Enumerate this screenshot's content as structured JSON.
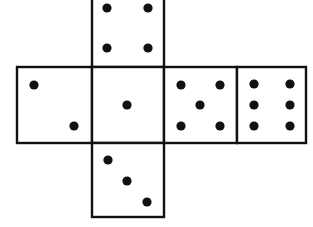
{
  "diagram": {
    "type": "cube-net",
    "background_color": "#ffffff",
    "line_color": "#111111",
    "pip_color": "#111111",
    "line_width": 2.4,
    "pip_radius": 4.6,
    "canvas": {
      "width": 313,
      "height": 227
    },
    "grid": {
      "columns_x": [
        17,
        92,
        164,
        237,
        306
      ],
      "rows_y": [
        -9,
        67,
        143,
        217
      ],
      "note": "top face is cropped at the top edge of the image"
    },
    "faces": [
      {
        "id": "face-top",
        "name": "top-face",
        "position": "top",
        "value": 4,
        "rect": {
          "x": 92,
          "y": -9,
          "width": 72,
          "height": 76
        },
        "pips": [
          {
            "cx": 107,
            "cy": 8
          },
          {
            "cx": 148,
            "cy": 8
          },
          {
            "cx": 107,
            "cy": 48
          },
          {
            "cx": 148,
            "cy": 48
          }
        ]
      },
      {
        "id": "face-left",
        "name": "left-face",
        "position": "left",
        "value": 2,
        "rect": {
          "x": 17,
          "y": 67,
          "width": 75,
          "height": 76
        },
        "pips": [
          {
            "cx": 34,
            "cy": 85
          },
          {
            "cx": 74,
            "cy": 126
          }
        ]
      },
      {
        "id": "face-center",
        "name": "center-face",
        "position": "center",
        "value": 1,
        "rect": {
          "x": 92,
          "y": 67,
          "width": 72,
          "height": 76
        },
        "pips": [
          {
            "cx": 127,
            "cy": 105
          }
        ]
      },
      {
        "id": "face-right",
        "name": "right-face",
        "position": "right",
        "value": 5,
        "rect": {
          "x": 164,
          "y": 67,
          "width": 73,
          "height": 76
        },
        "pips": [
          {
            "cx": 181,
            "cy": 85
          },
          {
            "cx": 220,
            "cy": 85
          },
          {
            "cx": 200,
            "cy": 105
          },
          {
            "cx": 181,
            "cy": 126
          },
          {
            "cx": 220,
            "cy": 126
          }
        ]
      },
      {
        "id": "face-far-right",
        "name": "far-right-face",
        "position": "far-right",
        "value": 6,
        "rect": {
          "x": 237,
          "y": 67,
          "width": 69,
          "height": 76
        },
        "pips": [
          {
            "cx": 254,
            "cy": 84
          },
          {
            "cx": 290,
            "cy": 84
          },
          {
            "cx": 254,
            "cy": 105
          },
          {
            "cx": 290,
            "cy": 105
          },
          {
            "cx": 254,
            "cy": 126
          },
          {
            "cx": 290,
            "cy": 126
          }
        ]
      },
      {
        "id": "face-bottom",
        "name": "bottom-face",
        "position": "bottom",
        "value": 3,
        "rect": {
          "x": 92,
          "y": 143,
          "width": 72,
          "height": 74
        },
        "pips": [
          {
            "cx": 108,
            "cy": 160
          },
          {
            "cx": 127,
            "cy": 181
          },
          {
            "cx": 147,
            "cy": 202
          }
        ]
      }
    ]
  }
}
